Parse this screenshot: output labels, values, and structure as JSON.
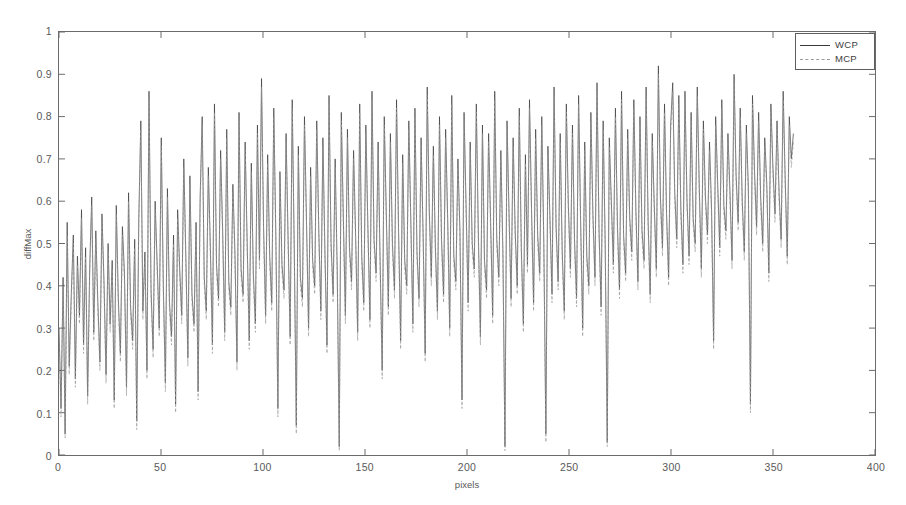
{
  "chart_data": {
    "type": "line",
    "title": "",
    "subtitle": "",
    "xlabel": "pixels",
    "ylabel": "diffMax",
    "xlim": [
      0,
      400
    ],
    "ylim": [
      0,
      1
    ],
    "xticks": [
      0,
      50,
      100,
      150,
      200,
      250,
      300,
      350,
      400
    ],
    "xtick_labels": [
      "0",
      "50",
      "100",
      "150",
      "200",
      "250",
      "300",
      "350",
      "400"
    ],
    "yticks": [
      0,
      0.1,
      0.2,
      0.3,
      0.4,
      0.5,
      0.6,
      0.7,
      0.8,
      0.9,
      1
    ],
    "ytick_labels": [
      "0",
      "0.1",
      "0.2",
      "0.3",
      "0.4",
      "0.5",
      "0.6",
      "0.7",
      "0.8",
      "0.9",
      "1"
    ],
    "grid": false,
    "legend_position": "upper-right",
    "legend": [
      "WCP",
      "MCP"
    ],
    "data_x_range": [
      0,
      360
    ],
    "series": [
      {
        "name": "WCP",
        "color": "#3a3a3a",
        "style": "solid",
        "values": [
          0.3,
          0.11,
          0.42,
          0.05,
          0.55,
          0.21,
          0.38,
          0.52,
          0.18,
          0.47,
          0.33,
          0.58,
          0.26,
          0.49,
          0.14,
          0.44,
          0.61,
          0.29,
          0.53,
          0.36,
          0.22,
          0.57,
          0.41,
          0.19,
          0.5,
          0.31,
          0.46,
          0.13,
          0.59,
          0.37,
          0.24,
          0.54,
          0.43,
          0.16,
          0.62,
          0.35,
          0.27,
          0.51,
          0.08,
          0.56,
          0.79,
          0.34,
          0.48,
          0.2,
          0.86,
          0.39,
          0.25,
          0.6,
          0.45,
          0.3,
          0.75,
          0.4,
          0.17,
          0.63,
          0.36,
          0.28,
          0.52,
          0.12,
          0.58,
          0.44,
          0.33,
          0.7,
          0.47,
          0.23,
          0.66,
          0.38,
          0.31,
          0.55,
          0.15,
          0.61,
          0.8,
          0.42,
          0.34,
          0.68,
          0.49,
          0.26,
          0.83,
          0.45,
          0.37,
          0.72,
          0.53,
          0.29,
          0.77,
          0.41,
          0.35,
          0.64,
          0.48,
          0.22,
          0.81,
          0.44,
          0.38,
          0.74,
          0.5,
          0.27,
          0.69,
          0.43,
          0.31,
          0.78,
          0.46,
          0.89,
          0.54,
          0.33,
          0.71,
          0.47,
          0.36,
          0.82,
          0.52,
          0.11,
          0.67,
          0.45,
          0.39,
          0.76,
          0.51,
          0.28,
          0.84,
          0.49,
          0.07,
          0.73,
          0.42,
          0.37,
          0.8,
          0.55,
          0.3,
          0.68,
          0.46,
          0.4,
          0.79,
          0.53,
          0.34,
          0.75,
          0.48,
          0.26,
          0.85,
          0.5,
          0.38,
          0.7,
          0.44,
          0.02,
          0.81,
          0.56,
          0.33,
          0.77,
          0.49,
          0.41,
          0.72,
          0.52,
          0.29,
          0.83,
          0.47,
          0.36,
          0.78,
          0.54,
          0.32,
          0.86,
          0.51,
          0.43,
          0.74,
          0.45,
          0.2,
          0.8,
          0.57,
          0.35,
          0.76,
          0.5,
          0.39,
          0.84,
          0.53,
          0.27,
          0.71,
          0.46,
          0.4,
          0.79,
          0.55,
          0.31,
          0.82,
          0.48,
          0.37,
          0.75,
          0.52,
          0.24,
          0.87,
          0.58,
          0.42,
          0.73,
          0.49,
          0.34,
          0.8,
          0.51,
          0.38,
          0.77,
          0.56,
          0.3,
          0.85,
          0.47,
          0.41,
          0.7,
          0.53,
          0.13,
          0.81,
          0.59,
          0.36,
          0.74,
          0.5,
          0.44,
          0.83,
          0.52,
          0.28,
          0.78,
          0.46,
          0.39,
          0.76,
          0.55,
          0.33,
          0.86,
          0.51,
          0.42,
          0.72,
          0.48,
          0.02,
          0.79,
          0.57,
          0.37,
          0.75,
          0.53,
          0.4,
          0.82,
          0.49,
          0.31,
          0.71,
          0.45,
          0.84,
          0.58,
          0.36,
          0.77,
          0.52,
          0.43,
          0.8,
          0.5,
          0.05,
          0.73,
          0.56,
          0.38,
          0.87,
          0.54,
          0.41,
          0.76,
          0.48,
          0.34,
          0.83,
          0.59,
          0.44,
          0.78,
          0.51,
          0.37,
          0.85,
          0.55,
          0.3,
          0.74,
          0.47,
          0.4,
          0.81,
          0.57,
          0.42,
          0.88,
          0.53,
          0.35,
          0.79,
          0.5,
          0.03,
          0.75,
          0.6,
          0.45,
          0.82,
          0.54,
          0.39,
          0.86,
          0.52,
          0.43,
          0.77,
          0.56,
          0.48,
          0.84,
          0.58,
          0.41,
          0.8,
          0.53,
          0.46,
          0.87,
          0.55,
          0.38,
          0.76,
          0.59,
          0.44,
          0.92,
          0.61,
          0.49,
          0.83,
          0.57,
          0.42,
          0.78,
          0.88,
          0.62,
          0.51,
          0.85,
          0.58,
          0.45,
          0.86,
          0.6,
          0.47,
          0.81,
          0.56,
          0.5,
          0.87,
          0.63,
          0.44,
          0.79,
          0.61,
          0.52,
          0.74,
          0.58,
          0.27,
          0.8,
          0.64,
          0.49,
          0.84,
          0.59,
          0.53,
          0.76,
          0.62,
          0.46,
          0.9,
          0.66,
          0.55,
          0.82,
          0.6,
          0.48,
          0.78,
          0.63,
          0.12,
          0.85,
          0.67,
          0.54,
          0.81,
          0.61,
          0.5,
          0.75,
          0.64,
          0.43,
          0.83,
          0.68,
          0.57,
          0.79,
          0.62,
          0.51,
          0.86,
          0.65,
          0.47,
          0.8,
          0.7,
          0.76
        ]
      },
      {
        "name": "MCP",
        "color": "#9a9a9a",
        "style": "dashed",
        "values": [
          0.28,
          0.09,
          0.4,
          0.04,
          0.52,
          0.19,
          0.36,
          0.5,
          0.16,
          0.45,
          0.31,
          0.56,
          0.24,
          0.47,
          0.12,
          0.42,
          0.59,
          0.27,
          0.51,
          0.34,
          0.2,
          0.55,
          0.39,
          0.17,
          0.48,
          0.29,
          0.44,
          0.11,
          0.57,
          0.35,
          0.22,
          0.52,
          0.41,
          0.14,
          0.6,
          0.33,
          0.25,
          0.49,
          0.06,
          0.54,
          0.77,
          0.32,
          0.46,
          0.18,
          0.84,
          0.37,
          0.23,
          0.58,
          0.43,
          0.28,
          0.73,
          0.38,
          0.15,
          0.61,
          0.34,
          0.26,
          0.5,
          0.1,
          0.56,
          0.42,
          0.31,
          0.68,
          0.45,
          0.21,
          0.64,
          0.36,
          0.29,
          0.53,
          0.13,
          0.59,
          0.78,
          0.4,
          0.32,
          0.66,
          0.47,
          0.24,
          0.81,
          0.43,
          0.35,
          0.7,
          0.51,
          0.27,
          0.75,
          0.39,
          0.33,
          0.62,
          0.46,
          0.2,
          0.79,
          0.42,
          0.36,
          0.72,
          0.48,
          0.25,
          0.67,
          0.41,
          0.29,
          0.76,
          0.44,
          0.87,
          0.52,
          0.31,
          0.69,
          0.45,
          0.34,
          0.8,
          0.5,
          0.09,
          0.65,
          0.43,
          0.37,
          0.74,
          0.49,
          0.26,
          0.82,
          0.47,
          0.05,
          0.71,
          0.4,
          0.35,
          0.78,
          0.53,
          0.28,
          0.66,
          0.44,
          0.38,
          0.77,
          0.51,
          0.32,
          0.73,
          0.46,
          0.24,
          0.83,
          0.48,
          0.36,
          0.68,
          0.42,
          0.01,
          0.79,
          0.54,
          0.31,
          0.75,
          0.47,
          0.39,
          0.7,
          0.5,
          0.27,
          0.81,
          0.45,
          0.34,
          0.76,
          0.52,
          0.3,
          0.84,
          0.49,
          0.41,
          0.72,
          0.43,
          0.18,
          0.78,
          0.55,
          0.33,
          0.74,
          0.48,
          0.37,
          0.82,
          0.51,
          0.25,
          0.69,
          0.44,
          0.38,
          0.77,
          0.53,
          0.29,
          0.8,
          0.46,
          0.35,
          0.73,
          0.5,
          0.22,
          0.85,
          0.56,
          0.4,
          0.71,
          0.47,
          0.32,
          0.78,
          0.49,
          0.36,
          0.75,
          0.54,
          0.28,
          0.83,
          0.45,
          0.39,
          0.68,
          0.51,
          0.11,
          0.79,
          0.57,
          0.34,
          0.72,
          0.48,
          0.42,
          0.81,
          0.5,
          0.26,
          0.76,
          0.44,
          0.37,
          0.74,
          0.53,
          0.31,
          0.84,
          0.49,
          0.4,
          0.7,
          0.46,
          0.01,
          0.77,
          0.55,
          0.35,
          0.73,
          0.51,
          0.38,
          0.8,
          0.47,
          0.29,
          0.69,
          0.43,
          0.82,
          0.56,
          0.34,
          0.75,
          0.5,
          0.41,
          0.78,
          0.48,
          0.03,
          0.71,
          0.54,
          0.36,
          0.85,
          0.52,
          0.39,
          0.74,
          0.46,
          0.32,
          0.81,
          0.57,
          0.42,
          0.76,
          0.49,
          0.35,
          0.83,
          0.53,
          0.28,
          0.72,
          0.45,
          0.38,
          0.79,
          0.55,
          0.4,
          0.86,
          0.51,
          0.33,
          0.77,
          0.48,
          0.02,
          0.73,
          0.58,
          0.43,
          0.8,
          0.52,
          0.37,
          0.84,
          0.5,
          0.41,
          0.75,
          0.54,
          0.46,
          0.82,
          0.56,
          0.39,
          0.78,
          0.51,
          0.44,
          0.85,
          0.53,
          0.36,
          0.74,
          0.57,
          0.42,
          0.9,
          0.59,
          0.47,
          0.81,
          0.55,
          0.4,
          0.76,
          0.86,
          0.6,
          0.49,
          0.83,
          0.56,
          0.43,
          0.84,
          0.58,
          0.45,
          0.79,
          0.54,
          0.48,
          0.85,
          0.61,
          0.42,
          0.77,
          0.59,
          0.5,
          0.72,
          0.56,
          0.25,
          0.78,
          0.62,
          0.47,
          0.82,
          0.57,
          0.51,
          0.74,
          0.6,
          0.44,
          0.88,
          0.64,
          0.53,
          0.8,
          0.58,
          0.46,
          0.76,
          0.61,
          0.1,
          0.83,
          0.65,
          0.52,
          0.79,
          0.59,
          0.48,
          0.73,
          0.62,
          0.41,
          0.81,
          0.66,
          0.55,
          0.77,
          0.6,
          0.49,
          0.84,
          0.63,
          0.45,
          0.78,
          0.68,
          0.74
        ]
      }
    ]
  },
  "axes": {
    "y_title": "diffMax",
    "x_title": "pixels"
  },
  "legend": {
    "entries": [
      {
        "label": "WCP",
        "color": "#3a3a3a",
        "style": "solid"
      },
      {
        "label": "MCP",
        "color": "#9a9a9a",
        "style": "dashed"
      }
    ]
  },
  "colors": {
    "background": "#ffffff",
    "axis": "#6b6b6b",
    "tick_text": "#5a5a5a",
    "wcp": "#3a3a3a",
    "mcp": "#9a9a9a"
  }
}
